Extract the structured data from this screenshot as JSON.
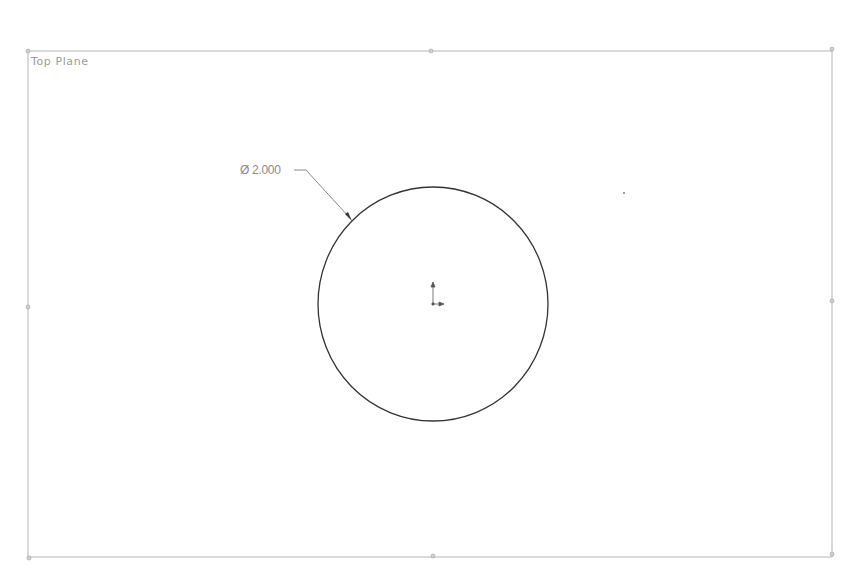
{
  "viewport": {
    "plane": {
      "label": "Top Plane",
      "color": "#9a9a9a"
    },
    "dimension": {
      "label": "Ø 2.000",
      "symbol": "diameter",
      "value": "2.000"
    },
    "sketch": {
      "entity": "circle",
      "center": [
        433,
        304
      ],
      "radius": 116,
      "color": "#333333"
    },
    "colors": {
      "background": "#ffffff",
      "frame": "#b5b5b5",
      "leader": "#6a6a6a"
    }
  }
}
